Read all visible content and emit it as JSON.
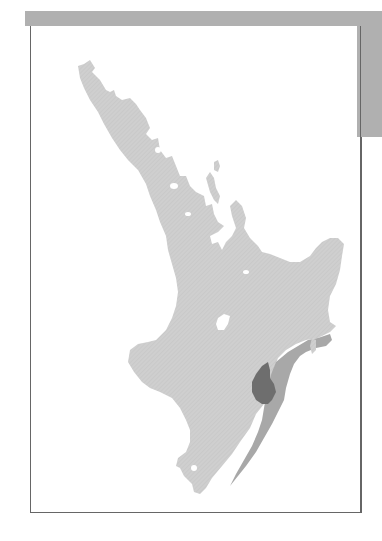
{
  "figure": {
    "type": "distribution map",
    "region": "North Island, New Zealand",
    "colors": {
      "land": "#cfcfcf",
      "zone_medium": "#a8a8a8",
      "zone_dark": "#6e6e6e",
      "frame": "#666666",
      "header_band": "#b0b0b0",
      "water": "#ffffff"
    },
    "zones": [
      {
        "name": "land",
        "shade": "light-gray"
      },
      {
        "name": "east-coast-band",
        "shade": "medium-gray"
      },
      {
        "name": "hawkes-bay-core",
        "shade": "dark-gray"
      }
    ]
  }
}
